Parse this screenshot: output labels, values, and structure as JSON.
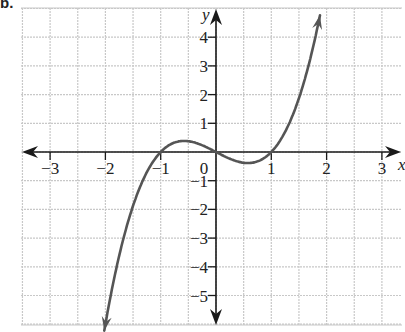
{
  "problem_label": "b.",
  "colors": {
    "grid": "#c8c8c8",
    "axis": "#1a1a1a",
    "curve": "#555555",
    "text": "#222222"
  },
  "chart_data": {
    "type": "line",
    "title": "",
    "function": "y = x^3 - x",
    "xlabel": "x",
    "ylabel": "y",
    "xlim": [
      -3.5,
      3.4
    ],
    "ylim": [
      -6.0,
      5.0
    ],
    "x_ticks": [
      -3,
      -2,
      -1,
      0,
      1,
      2,
      3
    ],
    "x_tick_labels": [
      "−3",
      "−2",
      "−1",
      "0",
      "1",
      "2",
      "3"
    ],
    "y_ticks": [
      -5,
      -4,
      -3,
      -2,
      -1,
      1,
      2,
      3,
      4
    ],
    "y_tick_labels": [
      "−5",
      "−4",
      "−3",
      "−2",
      "−1",
      "1",
      "2",
      "3",
      "4"
    ],
    "grid": true,
    "grid_x_step": 0.5,
    "grid_y_step": 1,
    "x_intercepts": [
      -1,
      0,
      1
    ],
    "local_max": [
      -0.58,
      0.38
    ],
    "local_min": [
      0.58,
      -0.38
    ],
    "arrows_on_ends": true,
    "series": [
      {
        "name": "f(x)",
        "x": [
          -2.02,
          -1.8,
          -1.6,
          -1.4,
          -1.2,
          -1.0,
          -0.8,
          -0.6,
          -0.4,
          -0.2,
          0.0,
          0.2,
          0.4,
          0.6,
          0.8,
          1.0,
          1.2,
          1.4,
          1.6,
          1.8,
          1.88
        ],
        "y": [
          -6.22,
          -4.03,
          -2.5,
          -1.34,
          -0.53,
          0.0,
          0.29,
          0.38,
          0.34,
          0.19,
          0.0,
          -0.19,
          -0.34,
          -0.38,
          -0.29,
          0.0,
          0.53,
          1.34,
          2.5,
          4.03,
          4.76
        ]
      }
    ]
  }
}
